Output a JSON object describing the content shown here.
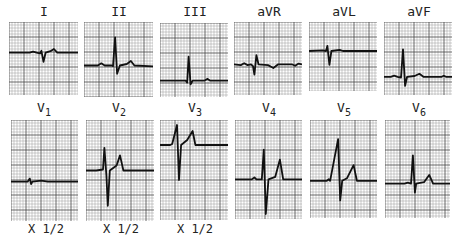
{
  "chart_data": {
    "type": "line",
    "grid": true,
    "leads": [
      {
        "name": "I",
        "row": 0,
        "col": 0,
        "x": 9,
        "y": 22,
        "w": 69,
        "h": 73,
        "baseline": 0.42,
        "scale": "",
        "trace": [
          [
            0,
            0
          ],
          [
            0.3,
            0
          ],
          [
            0.35,
            -0.03
          ],
          [
            0.4,
            0
          ],
          [
            0.45,
            0.02
          ],
          [
            0.47,
            -0.05
          ],
          [
            0.5,
            0.25
          ],
          [
            0.53,
            0
          ],
          [
            0.6,
            -0.04
          ],
          [
            0.65,
            -0.1
          ],
          [
            0.7,
            0
          ],
          [
            0.75,
            0
          ],
          [
            1,
            0
          ]
        ]
      },
      {
        "name": "II",
        "row": 0,
        "col": 1,
        "x": 84,
        "y": 22,
        "w": 69,
        "h": 75,
        "baseline": 0.58,
        "scale": "",
        "trace": [
          [
            0,
            0
          ],
          [
            0.2,
            0
          ],
          [
            0.25,
            -0.06
          ],
          [
            0.3,
            0
          ],
          [
            0.4,
            0
          ],
          [
            0.42,
            0.02
          ],
          [
            0.45,
            -0.75
          ],
          [
            0.48,
            0.22
          ],
          [
            0.52,
            0
          ],
          [
            0.62,
            -0.04
          ],
          [
            0.68,
            -0.12
          ],
          [
            0.73,
            0
          ],
          [
            1,
            0.02
          ]
        ]
      },
      {
        "name": "III",
        "row": 0,
        "col": 2,
        "x": 160,
        "y": 23,
        "w": 68,
        "h": 74,
        "baseline": 0.78,
        "scale": "",
        "trace": [
          [
            0,
            0
          ],
          [
            0.38,
            0
          ],
          [
            0.4,
            0.05
          ],
          [
            0.42,
            -0.65
          ],
          [
            0.45,
            0.1
          ],
          [
            0.48,
            0
          ],
          [
            0.65,
            0
          ],
          [
            0.7,
            -0.05
          ],
          [
            0.74,
            0
          ],
          [
            1,
            0
          ]
        ]
      },
      {
        "name": "aVR",
        "row": 0,
        "col": 3,
        "x": 234,
        "y": 22,
        "w": 68,
        "h": 73,
        "baseline": 0.58,
        "scale": "",
        "trace": [
          [
            0,
            0
          ],
          [
            0.1,
            0.02
          ],
          [
            0.15,
            -0.03
          ],
          [
            0.2,
            0.02
          ],
          [
            0.25,
            0
          ],
          [
            0.28,
            0.05
          ],
          [
            0.3,
            0.28
          ],
          [
            0.33,
            -0.25
          ],
          [
            0.36,
            0
          ],
          [
            0.5,
            0.02
          ],
          [
            0.58,
            0.1
          ],
          [
            0.65,
            0
          ],
          [
            0.85,
            0
          ],
          [
            0.9,
            0.04
          ],
          [
            0.95,
            -0.02
          ],
          [
            1,
            0
          ]
        ]
      },
      {
        "name": "aVL",
        "row": 0,
        "col": 4,
        "x": 309,
        "y": 22,
        "w": 68,
        "h": 69,
        "baseline": 0.42,
        "scale": "",
        "trace": [
          [
            0,
            0
          ],
          [
            0.2,
            -0.02
          ],
          [
            0.25,
            0
          ],
          [
            0.27,
            -0.15
          ],
          [
            0.3,
            0.4
          ],
          [
            0.33,
            0
          ],
          [
            0.45,
            -0.03
          ],
          [
            0.5,
            0
          ],
          [
            1,
            0
          ]
        ]
      },
      {
        "name": "aVF",
        "row": 0,
        "col": 5,
        "x": 384,
        "y": 22,
        "w": 68,
        "h": 73,
        "baseline": 0.75,
        "scale": "",
        "trace": [
          [
            0,
            0
          ],
          [
            0.1,
            0
          ],
          [
            0.15,
            -0.03
          ],
          [
            0.2,
            0
          ],
          [
            0.25,
            0.02
          ],
          [
            0.28,
            -0.75
          ],
          [
            0.31,
            0.25
          ],
          [
            0.34,
            0
          ],
          [
            0.45,
            -0.02
          ],
          [
            0.52,
            -0.08
          ],
          [
            0.58,
            0
          ],
          [
            0.85,
            0
          ],
          [
            0.88,
            -0.03
          ],
          [
            0.91,
            0
          ],
          [
            1,
            0
          ]
        ]
      },
      {
        "name": "V1",
        "row": 1,
        "col": 0,
        "x": 11,
        "y": 120,
        "w": 67,
        "h": 101,
        "baseline": 0.61,
        "scale": "X 1/2",
        "trace": [
          [
            0,
            0
          ],
          [
            0.25,
            0
          ],
          [
            0.28,
            -0.06
          ],
          [
            0.3,
            0.05
          ],
          [
            0.32,
            0
          ],
          [
            0.45,
            -0.02
          ],
          [
            0.55,
            0
          ],
          [
            1,
            0
          ]
        ]
      },
      {
        "name": "V2",
        "row": 1,
        "col": 1,
        "x": 86,
        "y": 120,
        "w": 68,
        "h": 101,
        "baseline": 0.5,
        "scale": "X 1/2",
        "trace": [
          [
            0,
            0
          ],
          [
            0.15,
            0
          ],
          [
            0.25,
            -0.02
          ],
          [
            0.27,
            -0.45
          ],
          [
            0.3,
            0.1
          ],
          [
            0.32,
            0.7
          ],
          [
            0.35,
            0
          ],
          [
            0.45,
            -0.1
          ],
          [
            0.5,
            -0.3
          ],
          [
            0.55,
            0
          ],
          [
            1,
            0
          ]
        ]
      },
      {
        "name": "V3",
        "row": 1,
        "col": 2,
        "x": 160,
        "y": 120,
        "w": 68,
        "h": 100,
        "baseline": 0.25,
        "scale": "X 1/2",
        "trace": [
          [
            0,
            0
          ],
          [
            0.15,
            0
          ],
          [
            0.18,
            -0.02
          ],
          [
            0.25,
            -0.4
          ],
          [
            0.28,
            0.7
          ],
          [
            0.31,
            0
          ],
          [
            0.4,
            -0.1
          ],
          [
            0.48,
            -0.28
          ],
          [
            0.52,
            0
          ],
          [
            1,
            0
          ]
        ]
      },
      {
        "name": "V4",
        "row": 1,
        "col": 3,
        "x": 235,
        "y": 120,
        "w": 67,
        "h": 99,
        "baseline": 0.6,
        "scale": "",
        "trace": [
          [
            0,
            0
          ],
          [
            0.25,
            0
          ],
          [
            0.29,
            -0.04
          ],
          [
            0.32,
            0
          ],
          [
            0.4,
            0
          ],
          [
            0.43,
            -0.6
          ],
          [
            0.46,
            0.7
          ],
          [
            0.5,
            0
          ],
          [
            0.6,
            -0.05
          ],
          [
            0.67,
            -0.4
          ],
          [
            0.72,
            0
          ],
          [
            1,
            0
          ]
        ]
      },
      {
        "name": "V5",
        "row": 1,
        "col": 4,
        "x": 310,
        "y": 120,
        "w": 67,
        "h": 98,
        "baseline": 0.62,
        "scale": "",
        "trace": [
          [
            0,
            0
          ],
          [
            0.25,
            0
          ],
          [
            0.28,
            -0.03
          ],
          [
            0.3,
            0
          ],
          [
            0.42,
            -0.85
          ],
          [
            0.45,
            0.4
          ],
          [
            0.48,
            0
          ],
          [
            0.55,
            -0.05
          ],
          [
            0.65,
            -0.32
          ],
          [
            0.7,
            0
          ],
          [
            1,
            0
          ]
        ]
      },
      {
        "name": "V6",
        "row": 1,
        "col": 5,
        "x": 385,
        "y": 120,
        "w": 65,
        "h": 98,
        "baseline": 0.65,
        "scale": "",
        "trace": [
          [
            0,
            0
          ],
          [
            0.3,
            0
          ],
          [
            0.35,
            -0.02
          ],
          [
            0.4,
            0
          ],
          [
            0.43,
            -0.58
          ],
          [
            0.46,
            0.18
          ],
          [
            0.48,
            0
          ],
          [
            0.6,
            -0.03
          ],
          [
            0.68,
            -0.18
          ],
          [
            0.74,
            0
          ],
          [
            1,
            0
          ]
        ]
      }
    ],
    "labels_rows": [
      [
        {
          "text": "I",
          "x": 9
        },
        {
          "text": "II",
          "x": 84
        },
        {
          "text": "III",
          "x": 160
        },
        {
          "text": "aVR",
          "x": 234
        },
        {
          "text": "aVL",
          "x": 309
        },
        {
          "text": "aVF",
          "x": 384
        }
      ],
      [
        {
          "text": "V",
          "sub": "1",
          "x": 9
        },
        {
          "text": "V",
          "sub": "2",
          "x": 84
        },
        {
          "text": "V",
          "sub": "3",
          "x": 160
        },
        {
          "text": "V",
          "sub": "4",
          "x": 234
        },
        {
          "text": "V",
          "sub": "5",
          "x": 309
        },
        {
          "text": "V",
          "sub": "6",
          "x": 384
        }
      ]
    ],
    "scale_notes": [
      "X 1/2",
      "X 1/2",
      "X 1/2"
    ]
  }
}
